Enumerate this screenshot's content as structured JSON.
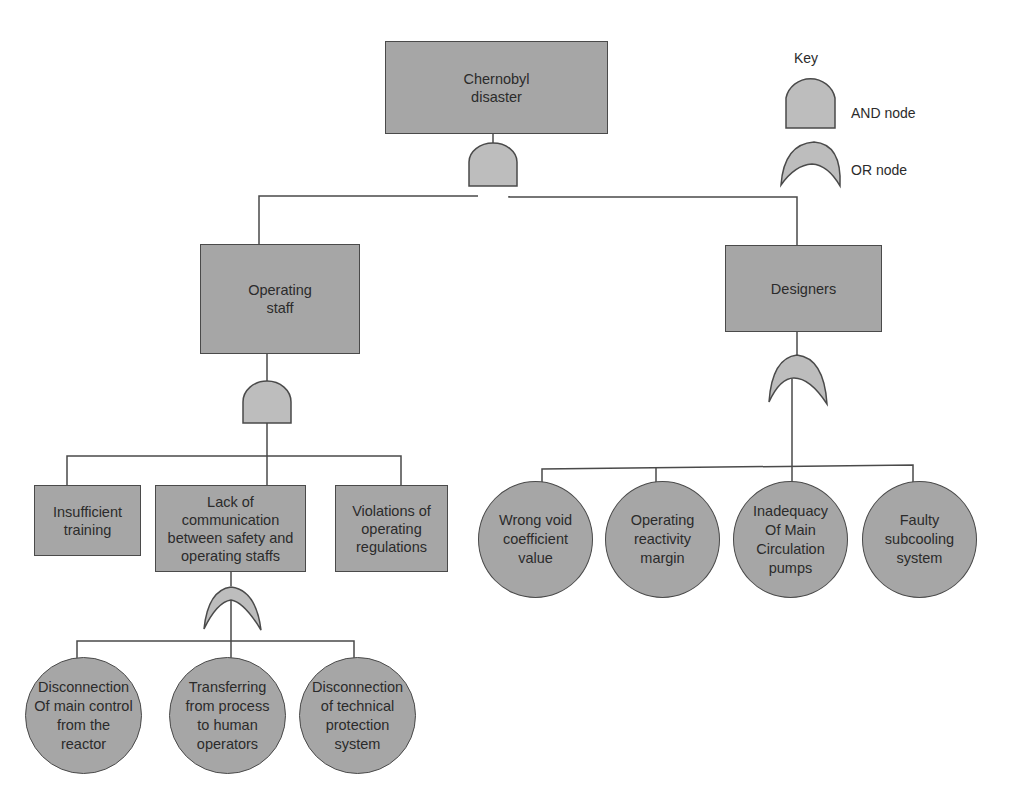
{
  "diagram": {
    "type": "fault-tree",
    "colors": {
      "node_fill": "#a6a6a6",
      "gate_fill": "#bdbdbd",
      "stroke": "#4a4a4a",
      "background": "#ffffff"
    },
    "key": {
      "title": "Key",
      "and_label": "AND node",
      "or_label": "OR node"
    },
    "top_event": {
      "label": "Chernobyl\ndisaster",
      "gate": "AND"
    },
    "branches": [
      {
        "label": "Operating\nstaff",
        "gate": "AND",
        "children": [
          {
            "label": "Insufficient\ntraining"
          },
          {
            "label": "Lack of\ncommunication\nbetween safety and\noperating staffs",
            "gate": "OR",
            "children": [
              {
                "label": "Disconnection\nOf main control\nfrom the\nreactor"
              },
              {
                "label": "Transferring\nfrom process\nto human\noperators"
              },
              {
                "label": "Disconnection\nof technical\nprotection\nsystem"
              }
            ]
          },
          {
            "label": "Violations of\noperating\nregulations"
          }
        ]
      },
      {
        "label": "Designers",
        "gate": "OR",
        "children": [
          {
            "label": "Wrong void\ncoefficient\nvalue"
          },
          {
            "label": "Operating\nreactivity\nmargin"
          },
          {
            "label": "Inadequacy\nOf Main\nCirculation\npumps"
          },
          {
            "label": "Faulty\nsubcooling\nsystem"
          }
        ]
      }
    ]
  }
}
